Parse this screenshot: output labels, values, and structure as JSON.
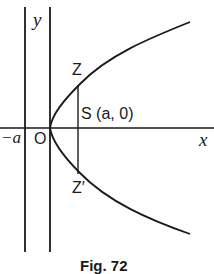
{
  "figure": {
    "caption": "Fig. 72",
    "labels": {
      "y_axis": "y",
      "x_axis": "x",
      "origin": "O",
      "neg_a": "−a",
      "focus": "S (a, 0)",
      "z_upper": "Z",
      "z_lower": "Z′"
    },
    "colors": {
      "stroke": "#1a1a1a",
      "background": "#ffffff"
    },
    "elements": {
      "curve": "parabola y² = 4ax opening right, vertex at O",
      "directrix": "vertical line x = −a",
      "latus_rectum": "vertical chord ZZ′ through focus S"
    }
  }
}
